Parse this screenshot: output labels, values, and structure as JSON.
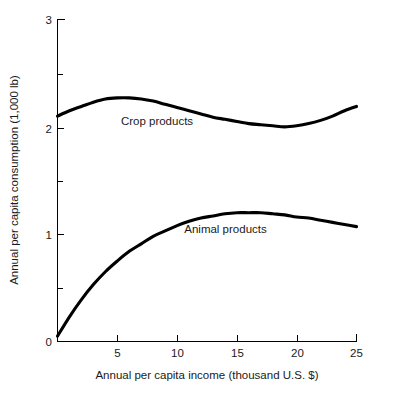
{
  "chart_data": {
    "type": "line",
    "title": "",
    "xlabel": "Annual per capita income (thousand U.S. $)",
    "ylabel": "Annual per capita consumption (1,000 lb)",
    "xlim": [
      0,
      25
    ],
    "ylim": [
      0,
      3
    ],
    "grid": false,
    "legend_position": "inline-annotation",
    "x_ticks_major": [
      5,
      10,
      15,
      20,
      25
    ],
    "x_tick_labels": [
      "5",
      "10",
      "15",
      "20",
      "25"
    ],
    "y_ticks_major": [
      0,
      1,
      2,
      3
    ],
    "y_tick_labels": [
      "0",
      "1",
      "2",
      "3"
    ],
    "y_ticks_minor": [
      0.5,
      1.5,
      2.5
    ],
    "line_color": "#000000",
    "background_color": "#ffffff",
    "x": [
      0,
      1,
      2,
      3,
      4,
      5,
      6,
      7,
      8,
      9,
      10,
      11,
      12,
      13,
      14,
      15,
      16,
      17,
      18,
      19,
      20,
      21,
      22,
      23,
      24,
      25
    ],
    "series": [
      {
        "name": "Crop products",
        "label": "Crop products",
        "label_x": 5.3,
        "label_y": 2.02,
        "values": [
          2.1,
          2.15,
          2.19,
          2.23,
          2.26,
          2.27,
          2.27,
          2.26,
          2.24,
          2.21,
          2.18,
          2.15,
          2.12,
          2.09,
          2.07,
          2.05,
          2.03,
          2.02,
          2.01,
          2.0,
          2.01,
          2.03,
          2.06,
          2.1,
          2.15,
          2.19
        ]
      },
      {
        "name": "Animal products",
        "label": "Animal products",
        "label_x": 10.6,
        "label_y": 1.01,
        "values": [
          0.05,
          0.23,
          0.39,
          0.53,
          0.65,
          0.75,
          0.84,
          0.91,
          0.98,
          1.03,
          1.08,
          1.12,
          1.15,
          1.17,
          1.19,
          1.2,
          1.2,
          1.2,
          1.19,
          1.18,
          1.16,
          1.15,
          1.13,
          1.11,
          1.09,
          1.07
        ]
      }
    ]
  }
}
